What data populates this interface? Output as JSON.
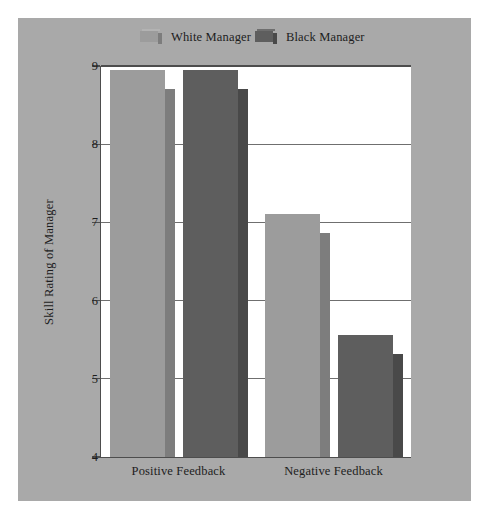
{
  "chart_data": {
    "type": "bar",
    "title": "",
    "xlabel": "",
    "ylabel": "Skill Rating of Manager",
    "categories": [
      "Positive Feedback",
      "Negative Feedback"
    ],
    "ylim": [
      4,
      9
    ],
    "yticks": [
      "4",
      "5",
      "6",
      "7",
      "8",
      "9"
    ],
    "grid": true,
    "legend_position": "top",
    "series": [
      {
        "name": "White Manager",
        "color": "#9c9c9c",
        "side_color": "#7d7d7d",
        "values": [
          8.95,
          7.11
        ]
      },
      {
        "name": "Black Manager",
        "color": "#5e5e5e",
        "side_color": "#494949",
        "values": [
          8.95,
          5.56
        ]
      }
    ],
    "colors": {
      "panel_background": "#a9a9a9",
      "plot_background": "#ffffff",
      "axis": "#4d4d4d",
      "gridline": "#6f6f6f",
      "text": "#1d1d1d"
    }
  }
}
